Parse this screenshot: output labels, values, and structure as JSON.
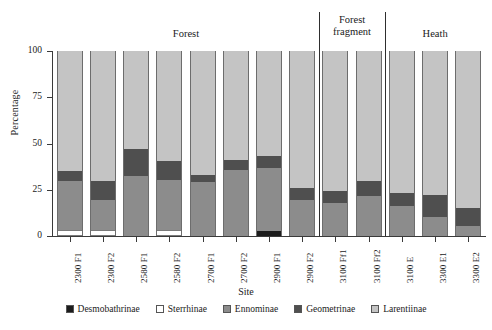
{
  "chart_data": {
    "type": "bar",
    "stacked": true,
    "title": "",
    "xlabel": "Site",
    "ylabel": "Percentage",
    "ylim": [
      0,
      100
    ],
    "yticks": [
      0,
      25,
      50,
      75,
      100
    ],
    "ytick_labels": [
      "0",
      "25",
      "50",
      "75",
      "100"
    ],
    "grid": false,
    "legend_position": "bottom",
    "categories": [
      "2300 F1",
      "2300 F2",
      "2580 F1",
      "2580 F2",
      "2700 F1",
      "2700 F2",
      "2900 F1",
      "2900 F2",
      "3100 Ff1",
      "3100 Ff2",
      "3100 E",
      "3300 E1",
      "3300 E2"
    ],
    "series": [
      {
        "name": "Desmobathrinae",
        "color": "#1c1c1c",
        "values": [
          0,
          0,
          0,
          0,
          0,
          0,
          2.5,
          0,
          0,
          0,
          0,
          0,
          0
        ]
      },
      {
        "name": "Sterrhinae",
        "color": "#ffffff",
        "values": [
          3.5,
          3.0,
          0,
          3.5,
          0,
          0,
          0,
          0,
          0,
          0,
          0,
          0,
          0
        ]
      },
      {
        "name": "Ennominae",
        "color": "#8c8c8c",
        "values": [
          26.5,
          16.5,
          32.5,
          27.0,
          29.0,
          35.5,
          34.5,
          19.5,
          18.0,
          21.5,
          16.0,
          10.5,
          5.5
        ]
      },
      {
        "name": "Geometrinae",
        "color": "#4f4f4f",
        "values": [
          5.0,
          10.0,
          14.5,
          10.0,
          4.0,
          5.5,
          6.0,
          6.5,
          6.5,
          8.5,
          7.5,
          11.5,
          9.5
        ]
      },
      {
        "name": "Larentiinae",
        "color": "#c4c4c4",
        "values": [
          65.0,
          70.5,
          53.0,
          59.5,
          67.0,
          59.0,
          57.0,
          74.0,
          75.5,
          70.0,
          76.5,
          78.0,
          85.0
        ]
      }
    ],
    "groups": [
      {
        "label": "Forest",
        "start": 0,
        "end": 7
      },
      {
        "label": "Forest\nfragment",
        "start": 8,
        "end": 9
      },
      {
        "label": "Heath",
        "start": 10,
        "end": 12
      }
    ],
    "group_labels": [
      "Forest",
      "Forest fragment",
      "Heath"
    ],
    "dividers_after": [
      7,
      9
    ]
  },
  "legend": {
    "items": [
      {
        "label": "Desmobathrinae",
        "color": "#1c1c1c"
      },
      {
        "label": "Sterrhinae",
        "color": "#ffffff"
      },
      {
        "label": "Ennominae",
        "color": "#8c8c8c"
      },
      {
        "label": "Geometrinae",
        "color": "#4f4f4f"
      },
      {
        "label": "Larentiinae",
        "color": "#c4c4c4"
      }
    ]
  },
  "axes": {
    "y_title": "Percentage",
    "x_title": "Site"
  }
}
